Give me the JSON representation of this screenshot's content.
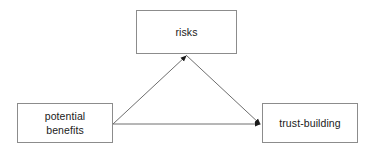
{
  "diagram": {
    "type": "node-link-diagram",
    "background_color": "#ffffff",
    "node_border_color": "#8c8c8c",
    "edge_color": "#666666",
    "text_color": "#1a1a1a",
    "nodes": [
      {
        "id": "risks",
        "label": "risks",
        "x": 136,
        "y": 10,
        "width": 101,
        "height": 44
      },
      {
        "id": "potential-benefits",
        "label": "potential\nbenefits",
        "x": 17,
        "y": 103,
        "width": 96,
        "height": 40
      },
      {
        "id": "trust-building",
        "label": "trust-building",
        "x": 262,
        "y": 103,
        "width": 96,
        "height": 40
      }
    ],
    "edges": [
      {
        "id": "benefits-to-risks",
        "from": "potential-benefits",
        "to": "risks",
        "arrowhead": "to",
        "from_point": [
          113,
          124
        ],
        "to_point": [
          186,
          55
        ]
      },
      {
        "id": "risks-to-trust",
        "from": "risks",
        "to": "trust-building",
        "arrowhead": "to",
        "from_point": [
          186,
          55
        ],
        "to_point": [
          261,
          124
        ]
      },
      {
        "id": "benefits-to-trust",
        "from": "potential-benefits",
        "to": "trust-building",
        "arrowhead": "to",
        "from_point": [
          113,
          124
        ],
        "to_point": [
          261,
          124
        ]
      }
    ]
  }
}
